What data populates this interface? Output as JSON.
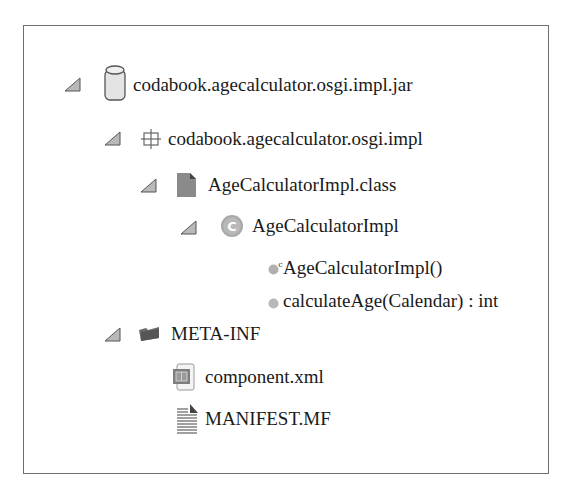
{
  "tree": {
    "jar": {
      "label": "codabook.agecalculator.osgi.impl.jar",
      "icon": "jar-icon",
      "expanded": true
    },
    "package": {
      "label": "codabook.agecalculator.osgi.impl",
      "icon": "package-icon",
      "expanded": true
    },
    "class_file": {
      "label": "AgeCalculatorImpl.class",
      "icon": "class-file-icon",
      "expanded": true
    },
    "class": {
      "label": "AgeCalculatorImpl",
      "icon": "class-icon",
      "icon_letter": "C",
      "expanded": true
    },
    "members": [
      {
        "label": "AgeCalculatorImpl()",
        "icon": "constructor-icon",
        "icon_superscript": "c"
      },
      {
        "label": "calculateAge(Calendar) : int",
        "icon": "method-icon"
      }
    ],
    "meta_inf": {
      "label": "META-INF",
      "icon": "folder-icon",
      "expanded": true
    },
    "files": [
      {
        "label": "component.xml",
        "icon": "xml-file-icon"
      },
      {
        "label": "MANIFEST.MF",
        "icon": "text-file-icon"
      }
    ]
  }
}
